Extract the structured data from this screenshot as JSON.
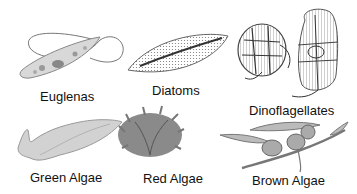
{
  "organisms": [
    {
      "id": "euglenas",
      "label": "Euglenas"
    },
    {
      "id": "diatoms",
      "label": "Diatoms"
    },
    {
      "id": "dinoflagellates",
      "label": "Dinoflagellates"
    },
    {
      "id": "green-algae",
      "label": "Green Algae"
    },
    {
      "id": "red-algae",
      "label": "Red Algae"
    },
    {
      "id": "brown-algae",
      "label": "Brown Algae"
    }
  ]
}
